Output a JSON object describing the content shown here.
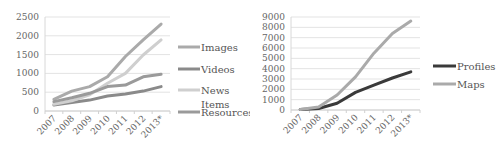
{
  "chart_data": [
    {
      "type": "line",
      "title": "",
      "xlabel": "",
      "ylabel": "",
      "categories": [
        "2007",
        "2008",
        "2009",
        "2010",
        "2011",
        "2012",
        "2013*"
      ],
      "ylim": [
        0,
        2500
      ],
      "yticks": [
        0,
        500,
        1000,
        1500,
        2000,
        2500
      ],
      "grid": true,
      "legend_position": "right",
      "series": [
        {
          "name": "Images",
          "color": "#aaaaaa",
          "values": [
            310,
            530,
            650,
            910,
            1450,
            1890,
            2310
          ]
        },
        {
          "name": "Videos",
          "color": "#8a8a8a",
          "values": [
            160,
            230,
            290,
            400,
            450,
            530,
            650
          ]
        },
        {
          "name": "News Items",
          "color": "#cfcfcf",
          "values": [
            180,
            270,
            430,
            740,
            1000,
            1490,
            1890
          ]
        },
        {
          "name": "Resources",
          "color": "#9a9a9a",
          "values": [
            250,
            350,
            470,
            650,
            690,
            910,
            980
          ]
        }
      ]
    },
    {
      "type": "line",
      "title": "",
      "xlabel": "",
      "ylabel": "",
      "categories": [
        "2007",
        "2008",
        "2009",
        "2010",
        "2011",
        "2012",
        "2013*"
      ],
      "ylim": [
        0,
        9000
      ],
      "yticks": [
        0,
        1000,
        2000,
        3000,
        4000,
        5000,
        6000,
        7000,
        8000,
        9000
      ],
      "grid": true,
      "legend_position": "right",
      "series": [
        {
          "name": "Profiles",
          "color": "#3a3a3a",
          "values": [
            50,
            150,
            650,
            1700,
            2400,
            3100,
            3700
          ]
        },
        {
          "name": "Maps",
          "color": "#aaaaaa",
          "values": [
            50,
            300,
            1450,
            3200,
            5500,
            7400,
            8600
          ]
        }
      ]
    }
  ],
  "legends": {
    "left": [
      "Images",
      "Videos",
      "News",
      "Items",
      "Resources"
    ],
    "right": [
      "Profiles",
      "Maps"
    ]
  }
}
